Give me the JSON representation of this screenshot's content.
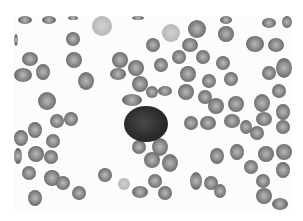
{
  "image": {
    "subject": "peripheral blood smear micrograph",
    "palette": "grayscale",
    "background_color": "#ffffff",
    "rbc_color": "#7a7a7a",
    "rbc_center_color": "#b8b8b8",
    "lymphocyte_color": "#262626"
  },
  "cells": [
    {
      "type": "rbc",
      "x": 18,
      "y": 16,
      "w": 14,
      "h": 8
    },
    {
      "type": "rbc",
      "x": 42,
      "y": 16,
      "w": 14,
      "h": 8
    },
    {
      "type": "rbc",
      "x": 68,
      "y": 16,
      "w": 10,
      "h": 4
    },
    {
      "type": "rbc-pale",
      "x": 92,
      "y": 16,
      "w": 20,
      "h": 20
    },
    {
      "type": "rbc",
      "x": 132,
      "y": 16,
      "w": 12,
      "h": 4
    },
    {
      "type": "rbc",
      "x": 220,
      "y": 16,
      "w": 12,
      "h": 8
    },
    {
      "type": "rbc",
      "x": 262,
      "y": 18,
      "w": 14,
      "h": 10
    },
    {
      "type": "rbc",
      "x": 282,
      "y": 16,
      "w": 10,
      "h": 12
    },
    {
      "type": "rbc",
      "x": 14,
      "y": 34,
      "w": 4,
      "h": 12
    },
    {
      "type": "rbc",
      "x": 66,
      "y": 32,
      "w": 14,
      "h": 14
    },
    {
      "type": "rbc-pale",
      "x": 162,
      "y": 24,
      "w": 18,
      "h": 18
    },
    {
      "type": "rbc",
      "x": 188,
      "y": 20,
      "w": 18,
      "h": 18
    },
    {
      "type": "rbc",
      "x": 218,
      "y": 26,
      "w": 16,
      "h": 16
    },
    {
      "type": "rbc",
      "x": 246,
      "y": 36,
      "w": 18,
      "h": 16
    },
    {
      "type": "rbc",
      "x": 268,
      "y": 38,
      "w": 16,
      "h": 14
    },
    {
      "type": "rbc",
      "x": 146,
      "y": 38,
      "w": 14,
      "h": 14
    },
    {
      "type": "rbc",
      "x": 182,
      "y": 38,
      "w": 16,
      "h": 14
    },
    {
      "type": "rbc",
      "x": 22,
      "y": 52,
      "w": 16,
      "h": 14
    },
    {
      "type": "rbc",
      "x": 66,
      "y": 52,
      "w": 16,
      "h": 16
    },
    {
      "type": "rbc",
      "x": 112,
      "y": 52,
      "w": 16,
      "h": 16
    },
    {
      "type": "rbc",
      "x": 172,
      "y": 50,
      "w": 14,
      "h": 14
    },
    {
      "type": "rbc",
      "x": 196,
      "y": 50,
      "w": 14,
      "h": 14
    },
    {
      "type": "rbc",
      "x": 216,
      "y": 56,
      "w": 14,
      "h": 14
    },
    {
      "type": "rbc",
      "x": 276,
      "y": 58,
      "w": 16,
      "h": 20
    },
    {
      "type": "rbc",
      "x": 14,
      "y": 68,
      "w": 18,
      "h": 14
    },
    {
      "type": "rbc",
      "x": 36,
      "y": 64,
      "w": 14,
      "h": 16
    },
    {
      "type": "rbc",
      "x": 78,
      "y": 72,
      "w": 16,
      "h": 18
    },
    {
      "type": "rbc",
      "x": 110,
      "y": 68,
      "w": 16,
      "h": 12
    },
    {
      "type": "rbc",
      "x": 128,
      "y": 60,
      "w": 16,
      "h": 16
    },
    {
      "type": "rbc",
      "x": 154,
      "y": 58,
      "w": 14,
      "h": 14
    },
    {
      "type": "rbc",
      "x": 180,
      "y": 66,
      "w": 16,
      "h": 16
    },
    {
      "type": "rbc",
      "x": 202,
      "y": 74,
      "w": 14,
      "h": 14
    },
    {
      "type": "rbc",
      "x": 224,
      "y": 72,
      "w": 14,
      "h": 14
    },
    {
      "type": "rbc",
      "x": 262,
      "y": 66,
      "w": 14,
      "h": 14
    },
    {
      "type": "rbc",
      "x": 132,
      "y": 76,
      "w": 16,
      "h": 16
    },
    {
      "type": "rbc",
      "x": 158,
      "y": 86,
      "w": 14,
      "h": 10
    },
    {
      "type": "rbc",
      "x": 178,
      "y": 84,
      "w": 16,
      "h": 16
    },
    {
      "type": "rbc",
      "x": 198,
      "y": 90,
      "w": 14,
      "h": 14
    },
    {
      "type": "rbc",
      "x": 38,
      "y": 92,
      "w": 18,
      "h": 18
    },
    {
      "type": "rbc",
      "x": 122,
      "y": 94,
      "w": 20,
      "h": 12
    },
    {
      "type": "rbc",
      "x": 146,
      "y": 86,
      "w": 12,
      "h": 12
    },
    {
      "type": "rbc",
      "x": 208,
      "y": 98,
      "w": 16,
      "h": 16
    },
    {
      "type": "rbc",
      "x": 228,
      "y": 96,
      "w": 16,
      "h": 16
    },
    {
      "type": "rbc",
      "x": 254,
      "y": 94,
      "w": 16,
      "h": 18
    },
    {
      "type": "rbc",
      "x": 272,
      "y": 84,
      "w": 14,
      "h": 14
    },
    {
      "type": "rbc",
      "x": 276,
      "y": 104,
      "w": 14,
      "h": 16
    },
    {
      "type": "rbc",
      "x": 50,
      "y": 114,
      "w": 14,
      "h": 14
    },
    {
      "type": "rbc",
      "x": 64,
      "y": 112,
      "w": 14,
      "h": 14
    },
    {
      "type": "rbc",
      "x": 184,
      "y": 116,
      "w": 14,
      "h": 14
    },
    {
      "type": "rbc",
      "x": 200,
      "y": 116,
      "w": 16,
      "h": 14
    },
    {
      "type": "rbc",
      "x": 224,
      "y": 114,
      "w": 16,
      "h": 14
    },
    {
      "type": "rbc",
      "x": 240,
      "y": 120,
      "w": 12,
      "h": 14
    },
    {
      "type": "rbc",
      "x": 250,
      "y": 126,
      "w": 14,
      "h": 14
    },
    {
      "type": "rbc",
      "x": 256,
      "y": 112,
      "w": 16,
      "h": 14
    },
    {
      "type": "rbc",
      "x": 276,
      "y": 120,
      "w": 14,
      "h": 14
    },
    {
      "type": "rbc",
      "x": 14,
      "y": 130,
      "w": 14,
      "h": 16
    },
    {
      "type": "rbc",
      "x": 28,
      "y": 122,
      "w": 14,
      "h": 16
    },
    {
      "type": "rbc",
      "x": 46,
      "y": 134,
      "w": 14,
      "h": 14
    },
    {
      "type": "rbc",
      "x": 132,
      "y": 140,
      "w": 14,
      "h": 14
    },
    {
      "type": "rbc",
      "x": 152,
      "y": 138,
      "w": 16,
      "h": 18
    },
    {
      "type": "rbc",
      "x": 14,
      "y": 148,
      "w": 8,
      "h": 16
    },
    {
      "type": "rbc",
      "x": 28,
      "y": 146,
      "w": 16,
      "h": 16
    },
    {
      "type": "rbc",
      "x": 44,
      "y": 150,
      "w": 14,
      "h": 14
    },
    {
      "type": "rbc",
      "x": 144,
      "y": 152,
      "w": 16,
      "h": 16
    },
    {
      "type": "rbc",
      "x": 162,
      "y": 154,
      "w": 16,
      "h": 18
    },
    {
      "type": "rbc",
      "x": 210,
      "y": 148,
      "w": 14,
      "h": 16
    },
    {
      "type": "rbc",
      "x": 230,
      "y": 144,
      "w": 14,
      "h": 16
    },
    {
      "type": "rbc",
      "x": 258,
      "y": 146,
      "w": 16,
      "h": 16
    },
    {
      "type": "rbc",
      "x": 276,
      "y": 144,
      "w": 16,
      "h": 16
    },
    {
      "type": "rbc",
      "x": 22,
      "y": 166,
      "w": 14,
      "h": 14
    },
    {
      "type": "rbc",
      "x": 44,
      "y": 170,
      "w": 16,
      "h": 16
    },
    {
      "type": "rbc",
      "x": 56,
      "y": 176,
      "w": 14,
      "h": 14
    },
    {
      "type": "rbc",
      "x": 98,
      "y": 168,
      "w": 14,
      "h": 14
    },
    {
      "type": "rbc",
      "x": 244,
      "y": 160,
      "w": 14,
      "h": 14
    },
    {
      "type": "rbc",
      "x": 276,
      "y": 162,
      "w": 14,
      "h": 16
    },
    {
      "type": "rbc",
      "x": 190,
      "y": 172,
      "w": 12,
      "h": 18
    },
    {
      "type": "rbc",
      "x": 204,
      "y": 176,
      "w": 14,
      "h": 14
    },
    {
      "type": "rbc-pale",
      "x": 118,
      "y": 178,
      "w": 12,
      "h": 12
    },
    {
      "type": "rbc",
      "x": 148,
      "y": 174,
      "w": 14,
      "h": 14
    },
    {
      "type": "rbc",
      "x": 256,
      "y": 174,
      "w": 14,
      "h": 14
    },
    {
      "type": "rbc",
      "x": 28,
      "y": 190,
      "w": 14,
      "h": 16
    },
    {
      "type": "rbc",
      "x": 72,
      "y": 186,
      "w": 14,
      "h": 14
    },
    {
      "type": "rbc",
      "x": 132,
      "y": 186,
      "w": 16,
      "h": 12
    },
    {
      "type": "rbc",
      "x": 158,
      "y": 186,
      "w": 14,
      "h": 14
    },
    {
      "type": "rbc",
      "x": 214,
      "y": 184,
      "w": 12,
      "h": 14
    },
    {
      "type": "rbc",
      "x": 256,
      "y": 188,
      "w": 16,
      "h": 16
    },
    {
      "type": "rbc",
      "x": 272,
      "y": 198,
      "w": 16,
      "h": 12
    },
    {
      "type": "lymphocyte",
      "x": 124,
      "y": 106,
      "w": 44,
      "h": 36
    }
  ]
}
